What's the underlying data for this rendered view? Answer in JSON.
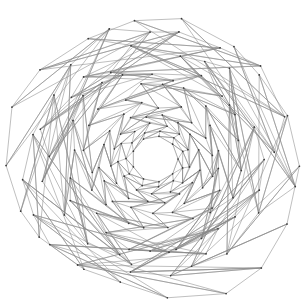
{
  "figure": {
    "name": "unstructured-triangular-mesh",
    "type": "finite-element-mesh-plot",
    "background_color": "#ffffff",
    "edge_color": "#8a8a8a",
    "node_color": "#3a3a3a",
    "edge_width": 0.55,
    "node_radius": 0.85,
    "width": 305,
    "height": 306,
    "title": "",
    "axes_visible": false,
    "axis_labels": {
      "x": "",
      "y": ""
    },
    "legend": [],
    "annotations": []
  },
  "chart_data": {
    "type": "mesh",
    "title": "",
    "xlabel": "",
    "ylabel": "",
    "xlim": [
      0,
      305
    ],
    "ylim": [
      0,
      306
    ],
    "grid": false,
    "legend_position": "none",
    "geometry": {
      "outer_boundary_shape": "irregular-circle",
      "outer_center": [
        152,
        155
      ],
      "outer_radius_mean": 142,
      "inner_hole_shape": "polygon",
      "inner_hole_sides": 9,
      "inner_center": [
        155,
        159
      ],
      "inner_radius": 23,
      "grading": "radial-refinement-toward-hole",
      "refinement_rings": 9,
      "node_count_estimate": 300,
      "element_count_estimate": 560
    },
    "ring_radii": [
      23,
      29,
      36,
      45,
      56,
      70,
      86,
      105,
      126,
      146
    ],
    "ring_node_counts": [
      9,
      11,
      13,
      16,
      18,
      20,
      22,
      22,
      20,
      18
    ],
    "ring_jitter": [
      0.0,
      0.14,
      0.2,
      0.26,
      0.32,
      0.38,
      0.44,
      0.5,
      0.5,
      0.46
    ],
    "ring_phase": [
      0.0,
      0.32,
      0.68,
      0.21,
      0.95,
      0.44,
      1.27,
      0.58,
      1.81,
      0.73
    ]
  }
}
